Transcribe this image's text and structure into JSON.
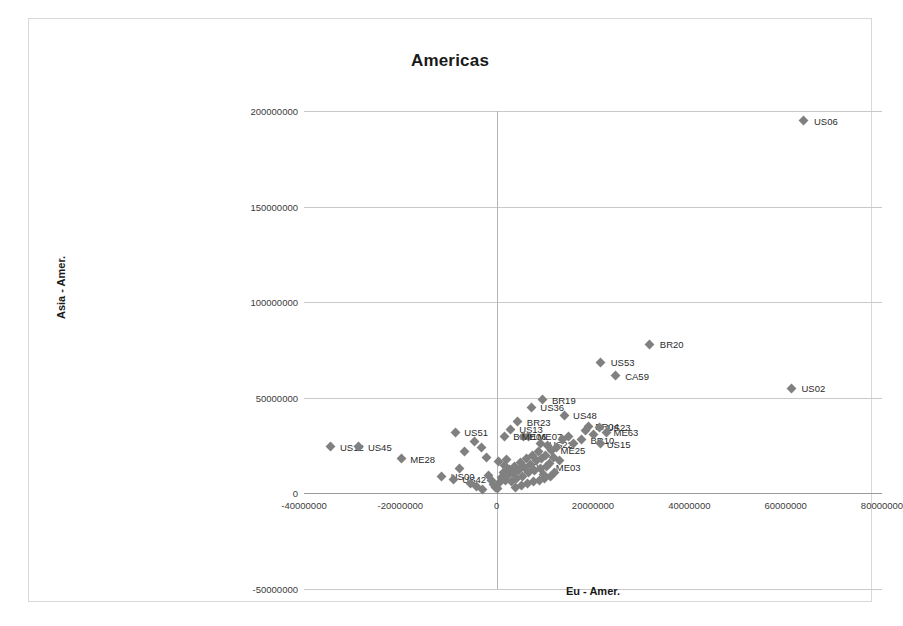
{
  "chart_data": {
    "type": "scatter",
    "title": "Americas",
    "xlabel": "Eu - Amer.",
    "ylabel": "Asia - Amer.",
    "xlim": [
      -40000000,
      80000000
    ],
    "ylim": [
      -50000000,
      200000000
    ],
    "xticks": [
      "-40000000",
      "-20000000",
      "0",
      "20000000",
      "40000000",
      "60000000",
      "80000000"
    ],
    "xtick_values": [
      -40000000,
      -20000000,
      0,
      20000000,
      40000000,
      60000000,
      80000000
    ],
    "yticks": [
      "200000000",
      "150000000",
      "100000000",
      "50000000",
      "0",
      "-50000000"
    ],
    "ytick_values": [
      200000000,
      150000000,
      100000000,
      50000000,
      0,
      -50000000
    ],
    "grid": "horizontal",
    "legend": "none",
    "marker": "diamond",
    "marker_color": "#808080",
    "points": [
      {
        "label": "US06",
        "x": 63800000,
        "y": 195000000,
        "lx": 10,
        "ly": 0
      },
      {
        "label": "US02",
        "x": 61200000,
        "y": 55000000,
        "lx": 10,
        "ly": 0
      },
      {
        "label": "BR20",
        "x": 31800000,
        "y": 78000000,
        "lx": 10,
        "ly": 0
      },
      {
        "label": "US53",
        "x": 21600000,
        "y": 68500000,
        "lx": 10,
        "ly": 0
      },
      {
        "label": "CA59",
        "x": 24600000,
        "y": 61500000,
        "lx": 10,
        "ly": 0
      },
      {
        "label": "BR19",
        "x": 9600000,
        "y": 49000000,
        "lx": 9,
        "ly": 0
      },
      {
        "label": "US36",
        "x": 7200000,
        "y": 45000000,
        "lx": 9,
        "ly": 0
      },
      {
        "label": "US48",
        "x": 14000000,
        "y": 41000000,
        "lx": 9,
        "ly": 0
      },
      {
        "label": "BR23",
        "x": 4400000,
        "y": 37500000,
        "lx": 9,
        "ly": 0
      },
      {
        "label": "US13",
        "x": 2800000,
        "y": 33500000,
        "lx": 9,
        "ly": 0
      },
      {
        "label": "BR21",
        "x": 1600000,
        "y": 30000000,
        "lx": 9,
        "ly": 0
      },
      {
        "label": "US51",
        "x": -8600000,
        "y": 32000000,
        "lx": 9,
        "ly": 0
      },
      {
        "label": "US12",
        "x": -34400000,
        "y": 24500000,
        "lx": 9,
        "ly": 0
      },
      {
        "label": "US45",
        "x": -28600000,
        "y": 24500000,
        "lx": 9,
        "ly": 0
      },
      {
        "label": "ME28",
        "x": -19800000,
        "y": 18000000,
        "lx": 9,
        "ly": 0
      },
      {
        "label": "US00",
        "x": -11400000,
        "y": 9000000,
        "lx": 9,
        "ly": 0
      },
      {
        "label": "US42",
        "x": -9000000,
        "y": 7500000,
        "lx": 9,
        "ly": 0
      },
      {
        "label": "ME07",
        "x": 6600000,
        "y": 30000000,
        "lx": 9,
        "ly": 0
      },
      {
        "label": "ME06",
        "x": 5600000,
        "y": 30000000,
        "lx": -2,
        "ly": 0
      },
      {
        "label": "US22",
        "x": 9000000,
        "y": 26000000,
        "lx": 9,
        "ly": 0
      },
      {
        "label": "ME25",
        "x": 11400000,
        "y": 22500000,
        "lx": 9,
        "ly": 0
      },
      {
        "label": "ME03",
        "x": 10400000,
        "y": 14000000,
        "lx": 9,
        "ly": 0
      },
      {
        "label": "ME30",
        "x": 1600000,
        "y": 14500000,
        "lx": 9,
        "ly": 0
      },
      {
        "label": "BR10",
        "x": 17600000,
        "y": 28000000,
        "lx": 9,
        "ly": 0
      },
      {
        "label": "US15",
        "x": 21600000,
        "y": 26000000,
        "lx": 6,
        "ly": 0
      },
      {
        "label": "BR04",
        "x": 19000000,
        "y": 35000000,
        "lx": 7,
        "ly": 0
      },
      {
        "label": "US23",
        "x": 21400000,
        "y": 34500000,
        "lx": 7,
        "ly": 0
      },
      {
        "label": "ME63",
        "x": 22800000,
        "y": 32000000,
        "lx": 7,
        "ly": 0
      },
      {
        "label": "",
        "x": -6600000,
        "y": 22000000,
        "lx": 0,
        "ly": 0
      },
      {
        "label": "",
        "x": -4600000,
        "y": 27000000,
        "lx": 0,
        "ly": 0
      },
      {
        "label": "",
        "x": -3200000,
        "y": 24000000,
        "lx": 0,
        "ly": 0
      },
      {
        "label": "",
        "x": -2200000,
        "y": 19000000,
        "lx": 0,
        "ly": 0
      },
      {
        "label": "",
        "x": -1600000,
        "y": 9500000,
        "lx": 0,
        "ly": 0
      },
      {
        "label": "",
        "x": -1000000,
        "y": 6500000,
        "lx": 0,
        "ly": 0
      },
      {
        "label": "",
        "x": -600000,
        "y": 4500000,
        "lx": 0,
        "ly": 0
      },
      {
        "label": "",
        "x": -200000,
        "y": 3000000,
        "lx": 0,
        "ly": 0
      },
      {
        "label": "",
        "x": 200000,
        "y": 2500000,
        "lx": 0,
        "ly": 0
      },
      {
        "label": "",
        "x": 600000,
        "y": 5500000,
        "lx": 0,
        "ly": 0
      },
      {
        "label": "",
        "x": 1000000,
        "y": 8500000,
        "lx": 0,
        "ly": 0
      },
      {
        "label": "",
        "x": 1400000,
        "y": 11000000,
        "lx": 0,
        "ly": 0
      },
      {
        "label": "",
        "x": 1800000,
        "y": 7000000,
        "lx": 0,
        "ly": 0
      },
      {
        "label": "",
        "x": 2200000,
        "y": 9500000,
        "lx": 0,
        "ly": 0
      },
      {
        "label": "",
        "x": 2600000,
        "y": 12500000,
        "lx": 0,
        "ly": 0
      },
      {
        "label": "",
        "x": 3000000,
        "y": 6000000,
        "lx": 0,
        "ly": 0
      },
      {
        "label": "",
        "x": 3400000,
        "y": 10500000,
        "lx": 0,
        "ly": 0
      },
      {
        "label": "",
        "x": 3800000,
        "y": 14000000,
        "lx": 0,
        "ly": 0
      },
      {
        "label": "",
        "x": 4200000,
        "y": 8000000,
        "lx": 0,
        "ly": 0
      },
      {
        "label": "",
        "x": 4600000,
        "y": 12000000,
        "lx": 0,
        "ly": 0
      },
      {
        "label": "",
        "x": 5000000,
        "y": 16000000,
        "lx": 0,
        "ly": 0
      },
      {
        "label": "",
        "x": 5400000,
        "y": 9000000,
        "lx": 0,
        "ly": 0
      },
      {
        "label": "",
        "x": 5800000,
        "y": 13500000,
        "lx": 0,
        "ly": 0
      },
      {
        "label": "",
        "x": 6200000,
        "y": 18000000,
        "lx": 0,
        "ly": 0
      },
      {
        "label": "",
        "x": 6600000,
        "y": 11000000,
        "lx": 0,
        "ly": 0
      },
      {
        "label": "",
        "x": 7000000,
        "y": 15000000,
        "lx": 0,
        "ly": 0
      },
      {
        "label": "",
        "x": 7400000,
        "y": 20000000,
        "lx": 0,
        "ly": 0
      },
      {
        "label": "",
        "x": 7800000,
        "y": 12000000,
        "lx": 0,
        "ly": 0
      },
      {
        "label": "",
        "x": 8200000,
        "y": 17000000,
        "lx": 0,
        "ly": 0
      },
      {
        "label": "",
        "x": 8600000,
        "y": 22000000,
        "lx": 0,
        "ly": 0
      },
      {
        "label": "",
        "x": 9000000,
        "y": 13000000,
        "lx": 0,
        "ly": 0
      },
      {
        "label": "",
        "x": 9400000,
        "y": 18500000,
        "lx": 0,
        "ly": 0
      },
      {
        "label": "",
        "x": 9800000,
        "y": 10000000,
        "lx": 0,
        "ly": 0
      },
      {
        "label": "",
        "x": 10200000,
        "y": 20000000,
        "lx": 0,
        "ly": 0
      },
      {
        "label": "",
        "x": 10600000,
        "y": 25000000,
        "lx": 0,
        "ly": 0
      },
      {
        "label": "",
        "x": 11000000,
        "y": 15500000,
        "lx": 0,
        "ly": 0
      },
      {
        "label": "",
        "x": 11800000,
        "y": 19000000,
        "lx": 0,
        "ly": 0
      },
      {
        "label": "",
        "x": 12400000,
        "y": 24000000,
        "lx": 0,
        "ly": 0
      },
      {
        "label": "",
        "x": 13000000,
        "y": 17000000,
        "lx": 0,
        "ly": 0
      },
      {
        "label": "",
        "x": 13600000,
        "y": 28000000,
        "lx": 0,
        "ly": 0
      },
      {
        "label": "",
        "x": 15000000,
        "y": 30000000,
        "lx": 0,
        "ly": 0
      },
      {
        "label": "",
        "x": 16000000,
        "y": 26000000,
        "lx": 0,
        "ly": 0
      },
      {
        "label": "",
        "x": 18400000,
        "y": 33000000,
        "lx": 0,
        "ly": 0
      },
      {
        "label": "",
        "x": 20000000,
        "y": 31000000,
        "lx": 0,
        "ly": 0
      },
      {
        "label": "",
        "x": -5400000,
        "y": 5000000,
        "lx": 0,
        "ly": 0
      },
      {
        "label": "",
        "x": -4200000,
        "y": 3500000,
        "lx": 0,
        "ly": 0
      },
      {
        "label": "",
        "x": -3000000,
        "y": 2000000,
        "lx": 0,
        "ly": 0
      },
      {
        "label": "",
        "x": -7800000,
        "y": 13000000,
        "lx": 0,
        "ly": 0
      },
      {
        "label": "",
        "x": 400000,
        "y": 16500000,
        "lx": 0,
        "ly": 0
      },
      {
        "label": "",
        "x": 2000000,
        "y": 17500000,
        "lx": 0,
        "ly": 0
      },
      {
        "label": "",
        "x": 4000000,
        "y": 3000000,
        "lx": 0,
        "ly": 0
      },
      {
        "label": "",
        "x": 5200000,
        "y": 4000000,
        "lx": 0,
        "ly": 0
      },
      {
        "label": "",
        "x": 6400000,
        "y": 5000000,
        "lx": 0,
        "ly": 0
      },
      {
        "label": "",
        "x": 7600000,
        "y": 6000000,
        "lx": 0,
        "ly": 0
      },
      {
        "label": "",
        "x": 8800000,
        "y": 7000000,
        "lx": 0,
        "ly": 0
      },
      {
        "label": "",
        "x": 10000000,
        "y": 8000000,
        "lx": 0,
        "ly": 0
      },
      {
        "label": "",
        "x": 11200000,
        "y": 9000000,
        "lx": 0,
        "ly": 0
      },
      {
        "label": "",
        "x": 12000000,
        "y": 11000000,
        "lx": 0,
        "ly": 0
      }
    ]
  }
}
